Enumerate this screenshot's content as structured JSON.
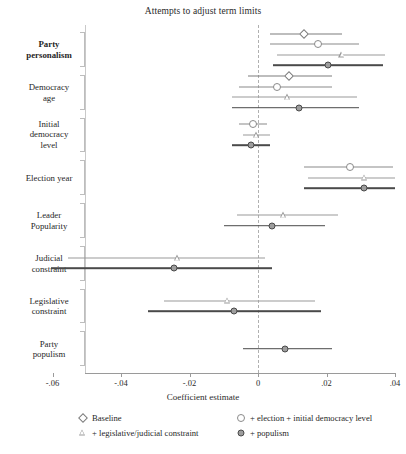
{
  "chart_data": {
    "type": "scatter",
    "subtype": "coefficient-forest-plot",
    "title": "Attempts to adjust term limits",
    "xlabel": "Coefficient estimate",
    "ylabel": "",
    "xlim": [
      -0.068,
      0.04
    ],
    "xticks": [
      -0.06,
      -0.04,
      -0.02,
      0,
      0.02,
      0.04
    ],
    "xticklabels": [
      "-.06",
      "-.04",
      "-.02",
      "0",
      ".02",
      ".04"
    ],
    "grid": false,
    "reference_line": 0,
    "legend_position": "below-axis",
    "legend": [
      {
        "name": "Baseline",
        "marker": "open-diamond"
      },
      {
        "name": "+ election + initial democracy level",
        "marker": "open-circle-small"
      },
      {
        "name": "+ legislative/judicial constraint",
        "marker": "open-triangle"
      },
      {
        "name": "+ populism",
        "marker": "filled-circle"
      }
    ],
    "categories": [
      "Party personalism",
      "Democracy age",
      "Initial democracy level",
      "Election year",
      "Leader Popularity",
      "Judicial constraint",
      "Legislative constraint",
      "Party populism"
    ],
    "groups": [
      {
        "category": "Party personalism",
        "label_lines": [
          "Party",
          "personalism"
        ],
        "bold": true,
        "points": [
          {
            "series": "Baseline",
            "marker": "open-diamond",
            "estimate": 0.0135,
            "ci_low": 0.0035,
            "ci_high": 0.0245
          },
          {
            "series": "+ election + initial democracy level",
            "marker": "open-circle-small",
            "estimate": 0.0175,
            "ci_low": 0.0035,
            "ci_high": 0.0295
          },
          {
            "series": "+ legislative/judicial constraint",
            "marker": "open-triangle",
            "estimate": 0.0245,
            "ci_low": 0.0055,
            "ci_high": 0.037
          },
          {
            "series": "+ populism",
            "marker": "filled-circle",
            "estimate": 0.0205,
            "ci_low": 0.0045,
            "ci_high": 0.0365
          }
        ]
      },
      {
        "category": "Democracy age",
        "label_lines": [
          "Democracy",
          "age"
        ],
        "bold": false,
        "points": [
          {
            "series": "Baseline",
            "marker": "open-diamond",
            "estimate": 0.009,
            "ci_low": -0.003,
            "ci_high": 0.0215
          },
          {
            "series": "+ election + initial democracy level",
            "marker": "open-circle-small",
            "estimate": 0.0055,
            "ci_low": -0.0055,
            "ci_high": 0.0215
          },
          {
            "series": "+ legislative/judicial constraint",
            "marker": "open-triangle",
            "estimate": 0.0085,
            "ci_low": -0.0075,
            "ci_high": 0.029
          },
          {
            "series": "+ populism",
            "marker": "filled-circle",
            "estimate": 0.012,
            "ci_low": -0.0075,
            "ci_high": 0.0295
          }
        ]
      },
      {
        "category": "Initial democracy level",
        "label_lines": [
          "Initial",
          "democracy",
          "level"
        ],
        "bold": false,
        "points": [
          {
            "series": "+ election + initial democracy level",
            "marker": "open-circle-small",
            "estimate": -0.0015,
            "ci_low": -0.0055,
            "ci_high": 0.0025
          },
          {
            "series": "+ legislative/judicial constraint",
            "marker": "open-triangle",
            "estimate": -0.0005,
            "ci_low": -0.0045,
            "ci_high": 0.0035
          },
          {
            "series": "+ populism",
            "marker": "filled-circle",
            "estimate": -0.002,
            "ci_low": -0.0075,
            "ci_high": 0.0035
          }
        ]
      },
      {
        "category": "Election year",
        "label_lines": [
          "Election year"
        ],
        "bold": false,
        "points": [
          {
            "series": "+ election + initial democracy level",
            "marker": "open-circle-small",
            "estimate": 0.027,
            "ci_low": 0.0135,
            "ci_high": 0.0395
          },
          {
            "series": "+ legislative/judicial constraint",
            "marker": "open-triangle",
            "estimate": 0.031,
            "ci_low": 0.0145,
            "ci_high": 0.04
          },
          {
            "series": "+ populism",
            "marker": "filled-circle",
            "estimate": 0.031,
            "ci_low": 0.0135,
            "ci_high": 0.04
          }
        ]
      },
      {
        "category": "Leader Popularity",
        "label_lines": [
          "Leader",
          "Popularity"
        ],
        "bold": false,
        "points": [
          {
            "series": "+ legislative/judicial constraint",
            "marker": "open-triangle",
            "estimate": 0.0075,
            "ci_low": -0.006,
            "ci_high": 0.0235
          },
          {
            "series": "+ populism",
            "marker": "filled-circle",
            "estimate": 0.004,
            "ci_low": -0.01,
            "ci_high": 0.0195
          }
        ]
      },
      {
        "category": "Judicial constraint",
        "label_lines": [
          "Judicial",
          "constraint"
        ],
        "bold": false,
        "points": [
          {
            "series": "+ legislative/judicial constraint",
            "marker": "open-triangle",
            "estimate": -0.0235,
            "ci_low": -0.0555,
            "ci_high": 0.002
          },
          {
            "series": "+ populism",
            "marker": "filled-circle",
            "estimate": -0.0245,
            "ci_low": -0.0605,
            "ci_high": 0.004
          }
        ]
      },
      {
        "category": "Legislative constraint",
        "label_lines": [
          "Legislative",
          "constraint"
        ],
        "bold": false,
        "points": [
          {
            "series": "+ legislative/judicial constraint",
            "marker": "open-triangle",
            "estimate": -0.009,
            "ci_low": -0.0275,
            "ci_high": 0.0165
          },
          {
            "series": "+ populism",
            "marker": "filled-circle",
            "estimate": -0.007,
            "ci_low": -0.032,
            "ci_high": 0.0185
          }
        ]
      },
      {
        "category": "Party populism",
        "label_lines": [
          "Party",
          "populism"
        ],
        "bold": false,
        "points": [
          {
            "series": "+ populism",
            "marker": "filled-circle",
            "estimate": 0.008,
            "ci_low": -0.0045,
            "ci_high": 0.0215
          }
        ]
      }
    ]
  },
  "colors": {
    "baseline": "#7c7c7c",
    "election": "#8a8a8a",
    "constraint": "#9a9a9a",
    "populism": "#4a4a4a",
    "axis": "#9a9a9a",
    "zeroline": "#b0b0b0",
    "text": "#1f1f1f"
  }
}
